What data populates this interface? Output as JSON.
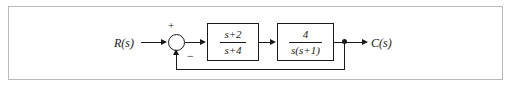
{
  "figure": {
    "type": "control-system-block-diagram",
    "background_color": "#ffffff",
    "border_color": "#b9b9b9",
    "line_color": "#1a1a1a"
  },
  "signals": {
    "input_label": "R(s)",
    "output_label": "C(s)"
  },
  "summing_junction": {
    "positive_sign": "+",
    "negative_sign": "−"
  },
  "blocks": [
    {
      "id": "G1",
      "numerator": "s+2",
      "denominator": "s+4"
    },
    {
      "id": "G2",
      "numerator": "4",
      "denominator": "s(s+1)"
    }
  ],
  "feedback": {
    "type": "unity",
    "sign": "negative"
  }
}
